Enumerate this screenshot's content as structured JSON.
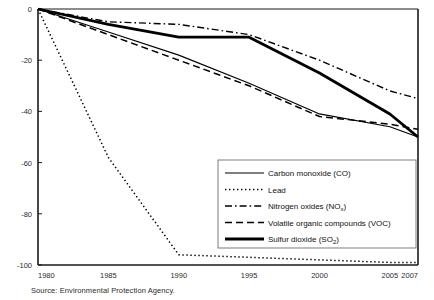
{
  "chart_data": {
    "type": "line",
    "title": "",
    "subtitle": "",
    "xlabel": "",
    "ylabel": "",
    "xlim": [
      1980,
      2007
    ],
    "ylim": [
      -100,
      0
    ],
    "grid": false,
    "legend_position": "bottom-right",
    "x_ticks": [
      "1980",
      "1985",
      "1990",
      "1995",
      "2000",
      "2005",
      "2007"
    ],
    "x_tick_values": [
      1980,
      1985,
      1990,
      1995,
      2000,
      2005,
      2007
    ],
    "y_ticks": [
      "0",
      "-20",
      "-40",
      "-60",
      "-80",
      "-100"
    ],
    "y_tick_values": [
      0,
      -20,
      -40,
      -60,
      -80,
      -100
    ],
    "x": [
      1980,
      1985,
      1990,
      1995,
      2000,
      2005,
      2007
    ],
    "series": [
      {
        "name": "Carbon monoxide (CO)",
        "key": "co",
        "style": "solid-thin",
        "color": "#000000",
        "values": [
          0,
          -9,
          -18,
          -29,
          -41,
          -46,
          -50
        ]
      },
      {
        "name": "Lead",
        "key": "lead",
        "style": "dotted",
        "color": "#000000",
        "values": [
          0,
          -58,
          -96,
          -97,
          -98,
          -99,
          -99
        ]
      },
      {
        "name": "Nitrogen oxides (NOₓ)",
        "key": "nox",
        "style": "dash-dot",
        "color": "#000000",
        "label_main": "Nitrogen oxides (NO",
        "label_sub": "x",
        "label_tail": ")",
        "values": [
          0,
          -5,
          -6,
          -10,
          -20,
          -32,
          -35
        ]
      },
      {
        "name": "Volatile organic compounds (VOC)",
        "key": "voc",
        "style": "dashed",
        "color": "#000000",
        "values": [
          0,
          -10,
          -20,
          -30,
          -42,
          -45,
          -47
        ]
      },
      {
        "name": "Sulfur dioxide (SO₂)",
        "key": "so2",
        "style": "solid-thick",
        "color": "#000000",
        "label_main": "Sulfur dioxide (SO",
        "label_sub": "2",
        "label_tail": ")",
        "values": [
          0,
          -6,
          -11,
          -11,
          -25,
          -41,
          -50
        ]
      }
    ],
    "source": "Source: Environmental Protection Agency."
  },
  "legend": {
    "items": [
      {
        "label": "Carbon monoxide (CO)",
        "style": "solid-thin"
      },
      {
        "label": "Lead",
        "style": "dotted"
      },
      {
        "label": "Nitrogen oxides (NOx)",
        "style": "dash-dot"
      },
      {
        "label": "Volatile organic compounds (VOC)",
        "style": "dashed"
      },
      {
        "label": "Sulfur dioxide (SO2)",
        "style": "solid-thick"
      }
    ]
  },
  "footer": {
    "source": "Source: Environmental Protection Agency."
  }
}
